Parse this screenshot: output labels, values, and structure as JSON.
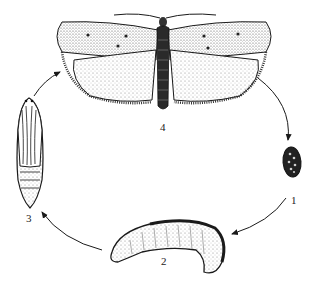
{
  "figure": {
    "type": "insect-life-cycle",
    "stages": [
      {
        "id": 1,
        "label": "1",
        "name": "egg"
      },
      {
        "id": 2,
        "label": "2",
        "name": "larva"
      },
      {
        "id": 3,
        "label": "3",
        "name": "pupa"
      },
      {
        "id": 4,
        "label": "4",
        "name": "adult moth"
      }
    ],
    "colors": {
      "ink": "#1a1a1a",
      "paper": "#ffffff",
      "shade": "#8a8a8a"
    }
  }
}
